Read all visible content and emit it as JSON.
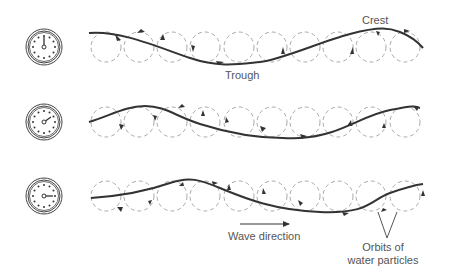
{
  "diagram": {
    "labels": {
      "crest": "Crest",
      "trough": "Trough",
      "wave_direction": "Wave direction",
      "orbits_line1": "Orbits of",
      "orbits_line2": "water particles"
    },
    "colors": {
      "wave_line": "#333333",
      "orbit_dashed": "#aaaaaa",
      "clock": "#444444",
      "text": "#555555"
    },
    "rows": [
      {
        "clock_time": "12:00",
        "hand_angle_deg": 0
      },
      {
        "clock_time": "1:30",
        "hand_angle_deg": 55
      },
      {
        "clock_time": "3:00",
        "hand_angle_deg": 88
      }
    ],
    "orbits_per_row": 10
  }
}
